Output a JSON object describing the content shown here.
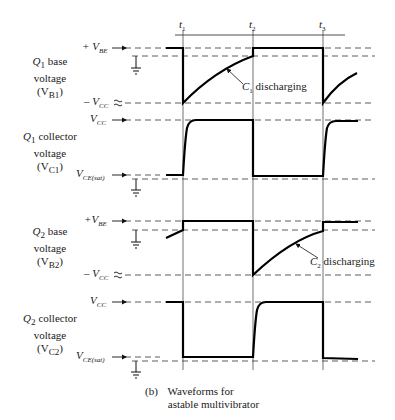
{
  "figure": {
    "caption_tag": "(b)",
    "caption_line1": "Waveforms for",
    "caption_line2": "astable multivibrator"
  },
  "time_markers": [
    {
      "label": "t",
      "sub": "1",
      "x": 183
    },
    {
      "label": "t",
      "sub": "2",
      "x": 253
    },
    {
      "label": "t",
      "sub": "3",
      "x": 323
    }
  ],
  "panels": [
    {
      "title_line1": "Q",
      "title_sub": "1",
      "title_rest": "base",
      "title_line2": "voltage",
      "title_line3_main": "(V",
      "title_line3_sub": "B1",
      "title_line3_end": ")",
      "levels": [
        {
          "prefix": "+ ",
          "main": "V",
          "sub": "BE",
          "marker": "arrow"
        },
        {
          "prefix": "– ",
          "main": "V",
          "sub": "CC",
          "marker": "approx"
        }
      ],
      "annotation": {
        "main": "C",
        "sub": "1",
        "text": " discharging"
      }
    },
    {
      "title_line1": "Q",
      "title_sub": "1",
      "title_rest": "collector",
      "title_line2": "voltage",
      "title_line3_main": "(V",
      "title_line3_sub": "C1",
      "title_line3_end": ")",
      "levels": [
        {
          "prefix": "",
          "main": "V",
          "sub": "CC",
          "marker": "arrow"
        },
        {
          "prefix": "",
          "main": "V",
          "sub": "CE(sat)",
          "marker": "arrow"
        }
      ]
    },
    {
      "title_line1": "Q",
      "title_sub": "2",
      "title_rest": "base",
      "title_line2": "voltage",
      "title_line3_main": "(V",
      "title_line3_sub": "B2",
      "title_line3_end": ")",
      "levels": [
        {
          "prefix": "+",
          "main": "V",
          "sub": "BE",
          "marker": "arrow"
        },
        {
          "prefix": "– ",
          "main": "V",
          "sub": "CC",
          "marker": "approx"
        }
      ],
      "annotation": {
        "main": "C",
        "sub": "2",
        "text": " discharging"
      }
    },
    {
      "title_line1": "Q",
      "title_sub": "2",
      "title_rest": "collector",
      "title_line2": "voltage",
      "title_line3_main": "(V",
      "title_line3_sub": "C2",
      "title_line3_end": ")",
      "levels": [
        {
          "prefix": "",
          "main": "V",
          "sub": "CC",
          "marker": "arrow"
        },
        {
          "prefix": "",
          "main": "V",
          "sub": "CE(sat)",
          "marker": "arrow"
        }
      ]
    }
  ]
}
